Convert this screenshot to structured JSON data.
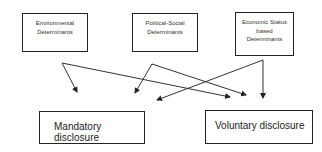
{
  "diagram": {
    "determinants": [
      {
        "id": "env",
        "lines": [
          "Environmental",
          "Determinants"
        ]
      },
      {
        "id": "pol",
        "lines": [
          "Political-Social",
          "Determinants"
        ]
      },
      {
        "id": "eco",
        "lines": [
          "Economic Status",
          "based",
          "Determinants"
        ]
      }
    ],
    "outcomes": [
      {
        "id": "mandatory",
        "label": "Mandatory disclosure"
      },
      {
        "id": "voluntary",
        "label": "Voluntary disclosure"
      }
    ],
    "edges": [
      {
        "from": "env",
        "to": "mandatory"
      },
      {
        "from": "env",
        "to": "voluntary"
      },
      {
        "from": "pol",
        "to": "mandatory"
      },
      {
        "from": "pol",
        "to": "voluntary"
      },
      {
        "from": "eco",
        "to": "mandatory"
      },
      {
        "from": "eco",
        "to": "voluntary"
      }
    ],
    "colors": {
      "stroke": "#222222",
      "background": "#ffffff"
    }
  }
}
